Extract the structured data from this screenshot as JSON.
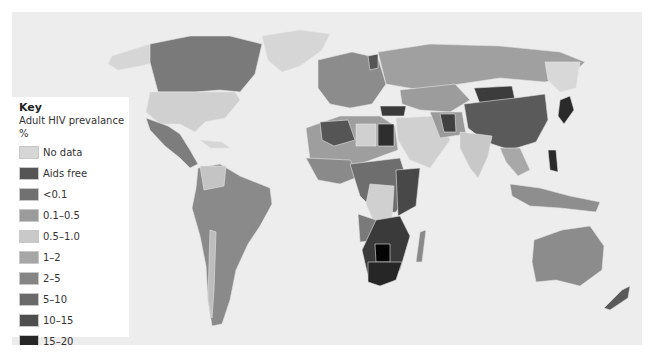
{
  "map": {
    "background": "#ededed",
    "country_fill_default": "#9a9a9a",
    "border_color": "#d8d8d8"
  },
  "legend": {
    "title": "Key",
    "subtitle": "Adult HIV prevalance %",
    "items": [
      {
        "label": "No data",
        "color": "#d6d6d6"
      },
      {
        "label": "Aids free",
        "color": "#555555"
      },
      {
        "label": "<0.1",
        "color": "#717171"
      },
      {
        "label": "0.1–0.5",
        "color": "#9b9b9b"
      },
      {
        "label": "0.5–1.0",
        "color": "#c9c9c9"
      },
      {
        "label": "1–2",
        "color": "#a6a6a6"
      },
      {
        "label": "2–5",
        "color": "#858585"
      },
      {
        "label": "5–10",
        "color": "#6a6a6a"
      },
      {
        "label": "10–15",
        "color": "#4e4e4e"
      },
      {
        "label": "15–20",
        "color": "#262626"
      },
      {
        "label": ">20",
        "color": "#050505"
      }
    ]
  }
}
